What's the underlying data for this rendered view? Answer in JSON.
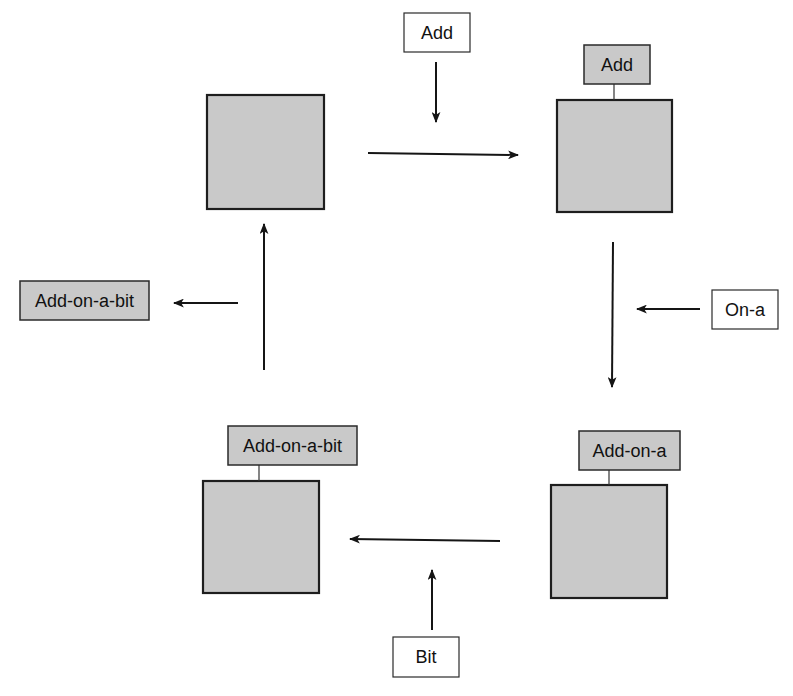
{
  "diagram": {
    "type": "cycle",
    "colors": {
      "square_fill": "#c9c9c9",
      "label_gray_fill": "#c9c9c9",
      "label_white_fill": "#ffffff",
      "stroke": "#1e1e1e"
    },
    "nodes": [
      {
        "id": "top-left",
        "tag": null
      },
      {
        "id": "top-right",
        "tag": "Add"
      },
      {
        "id": "bottom-right",
        "tag": "Add-on-a"
      },
      {
        "id": "bottom-left",
        "tag": "Add-on-a-bit"
      }
    ],
    "inputs": [
      {
        "text": "Add",
        "target_edge": "top-left -> top-right"
      },
      {
        "text": "On-a",
        "target_edge": "top-right -> bottom-right"
      },
      {
        "text": "Bit",
        "target_edge": "bottom-right -> bottom-left"
      }
    ],
    "output": {
      "text": "Add-on-a-bit",
      "source_edge": "bottom-left -> top-left"
    },
    "edges": [
      {
        "from": "top-left",
        "to": "top-right"
      },
      {
        "from": "top-right",
        "to": "bottom-right"
      },
      {
        "from": "bottom-right",
        "to": "bottom-left"
      },
      {
        "from": "bottom-left",
        "to": "top-left"
      }
    ]
  }
}
